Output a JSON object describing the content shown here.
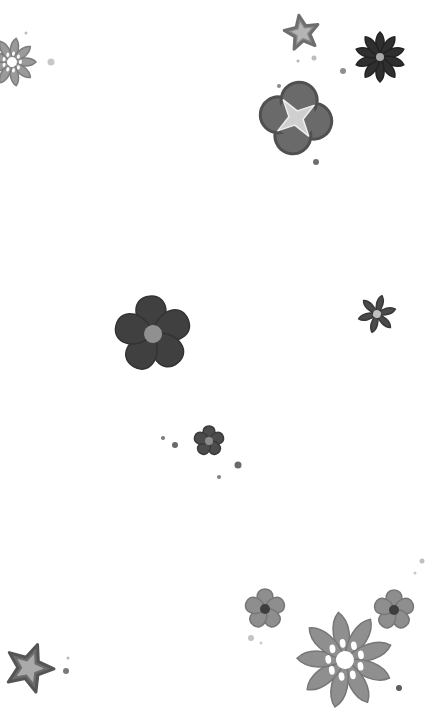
{
  "background": "#ffffff",
  "flowers": [
    {
      "name": "flower-topleft-daisy",
      "cx": 12,
      "cy": 62,
      "r": 24,
      "petals": 9,
      "shape": "daisy",
      "fill": "#9a9a9a",
      "stroke": "#7d7d7d",
      "center": "#ffffff",
      "centerR": 5,
      "rot": 10
    },
    {
      "name": "flower-top-star",
      "cx": 302,
      "cy": 33,
      "r": 18,
      "petals": 5,
      "shape": "star",
      "fill": "#8a8a8a",
      "stroke": "#6e6e6e",
      "center": "#b5b5b5",
      "centerR": 0,
      "rot": -10
    },
    {
      "name": "flower-top-dark-daisy",
      "cx": 380,
      "cy": 57,
      "r": 25,
      "petals": 10,
      "shape": "daisy",
      "fill": "#2f2f2f",
      "stroke": "#222222",
      "center": "#a8a8a8",
      "centerR": 4,
      "rot": 0
    },
    {
      "name": "flower-clover-star",
      "cx": 296,
      "cy": 118,
      "r": 40,
      "petals": 4,
      "shape": "clover",
      "fill": "#6a6a6a",
      "stroke": "#505050",
      "center": "#cfcfcf",
      "centerR": 0,
      "rot": 10
    },
    {
      "name": "flower-mid-dark-5petal",
      "cx": 153,
      "cy": 334,
      "r": 38,
      "petals": 5,
      "shape": "round",
      "fill": "#404040",
      "stroke": "#333333",
      "center": "#909090",
      "centerR": 9,
      "rot": -5
    },
    {
      "name": "flower-right-small-star",
      "cx": 377,
      "cy": 314,
      "r": 19,
      "petals": 6,
      "shape": "daisy",
      "fill": "#4a4a4a",
      "stroke": "#383838",
      "center": "#c0c0c0",
      "centerR": 4,
      "rot": 15
    },
    {
      "name": "flower-center-small",
      "cx": 209,
      "cy": 441,
      "r": 15,
      "petals": 5,
      "shape": "round",
      "fill": "#4c4c4c",
      "stroke": "#3a3a3a",
      "center": "#8c8c8c",
      "centerR": 4,
      "rot": 0
    },
    {
      "name": "flower-bottom-left-5petal",
      "cx": 265,
      "cy": 609,
      "r": 20,
      "petals": 5,
      "shape": "round",
      "fill": "#8e8e8e",
      "stroke": "#777777",
      "center": "#3e3e3e",
      "centerR": 5,
      "rot": 0
    },
    {
      "name": "flower-bottom-right-5petal",
      "cx": 394,
      "cy": 610,
      "r": 20,
      "petals": 5,
      "shape": "round",
      "fill": "#8e8e8e",
      "stroke": "#777777",
      "center": "#3e3e3e",
      "centerR": 5,
      "rot": 0
    },
    {
      "name": "flower-bottom-big-daisy",
      "cx": 345,
      "cy": 660,
      "r": 48,
      "petals": 9,
      "shape": "daisy",
      "fill": "#8f8f8f",
      "stroke": "#777777",
      "center": "#ffffff",
      "centerR": 9,
      "rot": -8
    },
    {
      "name": "flower-bottom-left-star",
      "cx": 29,
      "cy": 668,
      "r": 25,
      "petals": 5,
      "shape": "star",
      "fill": "#6c6c6c",
      "stroke": "#555555",
      "center": "#aaaaaa",
      "centerR": 0,
      "rot": 20
    }
  ],
  "dots": [
    {
      "cx": 26,
      "cy": 33,
      "r": 1.5,
      "fill": "#bdbdbd"
    },
    {
      "cx": 51,
      "cy": 62,
      "r": 3.5,
      "fill": "#c8c8c8"
    },
    {
      "cx": 298,
      "cy": 61,
      "r": 1.5,
      "fill": "#b5b5b5"
    },
    {
      "cx": 314,
      "cy": 58,
      "r": 2.5,
      "fill": "#bcbcbc"
    },
    {
      "cx": 343,
      "cy": 71,
      "r": 3,
      "fill": "#8e8e8e"
    },
    {
      "cx": 279,
      "cy": 86,
      "r": 2,
      "fill": "#8a8a8a"
    },
    {
      "cx": 316,
      "cy": 162,
      "r": 3,
      "fill": "#6e6e6e"
    },
    {
      "cx": 163,
      "cy": 438,
      "r": 2,
      "fill": "#7a7a7a"
    },
    {
      "cx": 175,
      "cy": 445,
      "r": 3,
      "fill": "#6a6a6a"
    },
    {
      "cx": 238,
      "cy": 465,
      "r": 3.5,
      "fill": "#6a6a6a"
    },
    {
      "cx": 219,
      "cy": 477,
      "r": 2,
      "fill": "#808080"
    },
    {
      "cx": 422,
      "cy": 561,
      "r": 2.5,
      "fill": "#c0c0c0"
    },
    {
      "cx": 415,
      "cy": 573,
      "r": 1.5,
      "fill": "#c8c8c8"
    },
    {
      "cx": 251,
      "cy": 638,
      "r": 3,
      "fill": "#c4c4c4"
    },
    {
      "cx": 261,
      "cy": 643,
      "r": 1.5,
      "fill": "#cccccc"
    },
    {
      "cx": 399,
      "cy": 688,
      "r": 3,
      "fill": "#5e5e5e"
    },
    {
      "cx": 68,
      "cy": 658,
      "r": 1.5,
      "fill": "#b8b8b8"
    },
    {
      "cx": 66,
      "cy": 671,
      "r": 3,
      "fill": "#7a7a7a"
    }
  ]
}
